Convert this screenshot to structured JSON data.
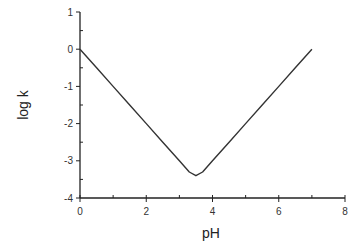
{
  "chart_data": {
    "type": "line",
    "title": "",
    "xlabel": "pH",
    "ylabel": "log k",
    "xlim": [
      0,
      8
    ],
    "ylim": [
      -4,
      1
    ],
    "x_ticks": [
      0,
      2,
      4,
      6,
      8
    ],
    "y_ticks": [
      1,
      0,
      -1,
      -2,
      -3,
      -4
    ],
    "x_tick_labels": [
      "0",
      "2",
      "4",
      "6",
      "8"
    ],
    "y_tick_labels": [
      "1",
      "0",
      "-1",
      "-2",
      "-3",
      "-4"
    ],
    "grid": false,
    "legend": null,
    "series": [
      {
        "name": "log k vs pH",
        "x": [
          0,
          0.5,
          1,
          1.5,
          2,
          2.5,
          3,
          3.3,
          3.5,
          3.7,
          4,
          4.5,
          5,
          5.5,
          6,
          6.5,
          7
        ],
        "y": [
          0,
          -0.5,
          -1,
          -1.5,
          -2,
          -2.5,
          -3,
          -3.3,
          -3.4,
          -3.3,
          -3,
          -2.5,
          -2,
          -1.5,
          -1,
          -0.5,
          0
        ]
      }
    ]
  }
}
